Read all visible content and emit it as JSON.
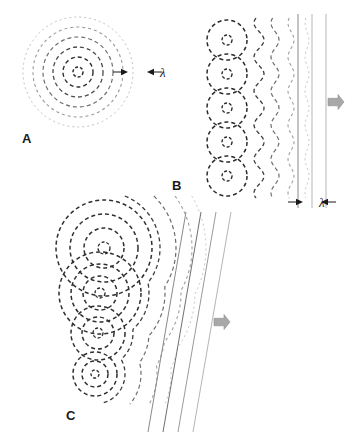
{
  "figure": {
    "background_color": "#ffffff",
    "width": 360,
    "height": 442,
    "ink_color": "#1a1a1a",
    "arrow_color": "#a8a8a8"
  },
  "panels": [
    {
      "id": "A",
      "label": "A",
      "label_x": 22,
      "label_y": 143,
      "caption": "Circular wavefronts spreading from a single point source",
      "source_count": 1,
      "sources": [
        {
          "cx": 78,
          "cy": 72,
          "rings": [
            {
              "r": 5,
              "color": "#2b2b2b",
              "width": 1.5,
              "dash": "3,2"
            },
            {
              "r": 15,
              "color": "#2f2f2f",
              "width": 1.4,
              "dash": "4,3"
            },
            {
              "r": 25,
              "color": "#4a4a4a",
              "width": 1.3,
              "dash": "4,3"
            },
            {
              "r": 35,
              "color": "#6f6f6f",
              "width": 1.2,
              "dash": "4,3"
            },
            {
              "r": 45,
              "color": "#9a9a9a",
              "width": 1.1,
              "dash": "3,3"
            },
            {
              "r": 55,
              "color": "#c0c0c0",
              "width": 1.0,
              "dash": "2,3"
            }
          ]
        }
      ],
      "dimension": {
        "label": "λ",
        "label_x": 160,
        "label_y": 77,
        "from_x": 123,
        "to_x": 152,
        "y": 72,
        "description": "wavelength is the radial spacing between successive wavefronts"
      }
    },
    {
      "id": "B",
      "label": "B",
      "label_x": 172,
      "label_y": 190,
      "caption": "Row of in-phase sources of equal radius builds a straight plane wave",
      "source_count": 5,
      "source_cx": 227,
      "source_cys": [
        40,
        74,
        108,
        142,
        176
      ],
      "ring_radii": [
        5,
        20
      ],
      "composite_fronts": [
        {
          "x_offset": 32,
          "color": "#3a3a3a",
          "width": 1.3,
          "dash": "4,3",
          "scallop": 5
        },
        {
          "x_offset": 48,
          "color": "#6b6b6b",
          "width": 1.2,
          "dash": "4,3",
          "scallop": 4
        },
        {
          "x_offset": 64,
          "color": "#9e9e9e",
          "width": 1.1,
          "dash": "3,3",
          "scallop": 3
        },
        {
          "x_offset": 80,
          "color": "#c4c4c4",
          "width": 1.0,
          "dash": "2,3",
          "scallop": 2
        }
      ],
      "plane_lines": [
        {
          "x": 298,
          "color": "#8a8a8a",
          "width": 1.0
        },
        {
          "x": 312,
          "color": "#b5b5b5",
          "width": 1.0
        },
        {
          "x": 326,
          "color": "#b5b5b5",
          "width": 1.0
        }
      ],
      "plane_top": 14,
      "plane_bottom": 208,
      "dimension": {
        "label": "λ",
        "label_x": 319,
        "label_y": 207,
        "from_x": 298,
        "to_x": 326,
        "y": 202,
        "description": "wavelength equals the spacing between adjacent plane wavefronts"
      },
      "propagation_arrow": {
        "x": 336,
        "y": 102,
        "direction": "right",
        "label": "direction of propagation"
      }
    },
    {
      "id": "C",
      "label": "C",
      "label_x": 66,
      "label_y": 420,
      "caption": "Sources emitting with graded delay produce a tilted, refracted wavefront",
      "source_count": 4,
      "sources": [
        {
          "cx": 104,
          "cy": 248,
          "rings": [
            6,
            20,
            34,
            48
          ]
        },
        {
          "cx": 100,
          "cy": 293,
          "rings": [
            5,
            17,
            29,
            41
          ]
        },
        {
          "cx": 98,
          "cy": 333,
          "rings": [
            5,
            16,
            27
          ]
        },
        {
          "cx": 95,
          "cy": 374,
          "rings": [
            4,
            13,
            22
          ]
        }
      ],
      "composite_fronts": [
        {
          "color": "#3a3a3a",
          "width": 1.3,
          "dash": "4,3",
          "offset": 0
        },
        {
          "color": "#6b6b6b",
          "width": 1.2,
          "dash": "4,3",
          "offset": 16
        },
        {
          "color": "#9e9e9e",
          "width": 1.1,
          "dash": "3,3",
          "offset": 32
        },
        {
          "color": "#c4c4c4",
          "width": 1.0,
          "dash": "2,3",
          "offset": 46
        }
      ],
      "tilt_lines": [
        {
          "x_top": 186,
          "x_bottom": 148,
          "color": "#8a8a8a",
          "width": 1.0
        },
        {
          "x_top": 201,
          "x_bottom": 163,
          "color": "#6f6f6f",
          "width": 1.0
        },
        {
          "x_top": 216,
          "x_bottom": 178,
          "color": "#9a9a9a",
          "width": 1.0
        },
        {
          "x_top": 231,
          "x_bottom": 193,
          "color": "#b5b5b5",
          "width": 1.0
        }
      ],
      "tilt_top": 212,
      "tilt_bottom": 432,
      "tilt_angle_deg": 10,
      "propagation_arrow": {
        "x": 222,
        "y": 322,
        "direction": "right",
        "label": "direction of propagation"
      }
    }
  ]
}
